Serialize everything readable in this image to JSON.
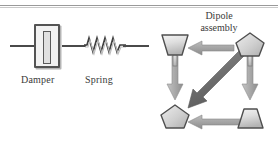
{
  "figure": {
    "background": "#ffffff",
    "rule_color": "#9a9a9a"
  },
  "mechanical_schematic": {
    "damper": {
      "label": "Damper",
      "icon": "damper-symbol",
      "body_fill": "#f2f2f2",
      "outline": "#545454"
    },
    "spring": {
      "label": "Spring",
      "icon": "spring-coil-symbol",
      "coils": 7,
      "stroke": "#3f3f3f"
    },
    "connector_line_color": "#4a4a4a"
  },
  "dipole_assembly": {
    "title_line1": "Dipole",
    "title_line2": "assembly",
    "node_fill_light": "#e8e8e8",
    "node_fill_mid": "#c2c2c2",
    "node_outline": "#4f4f4f",
    "arrow_fill": "#a9a9a9",
    "arrow_fill_dark": "#6f6f6f",
    "nodes": [
      {
        "id": "top-left",
        "shape": "trapezoid-wide-top",
        "position": "top-left"
      },
      {
        "id": "top-right",
        "shape": "pentagon",
        "position": "top-right"
      },
      {
        "id": "bottom-left",
        "shape": "pentagon",
        "position": "bottom-left"
      },
      {
        "id": "bottom-right",
        "shape": "trapezoid-wide-bottom",
        "position": "bottom-right"
      }
    ],
    "arrows": [
      {
        "id": "top-right-to-top-left",
        "direction": "leftward",
        "shade": "light"
      },
      {
        "id": "top-left-to-bottom-left",
        "direction": "downward",
        "shade": "light"
      },
      {
        "id": "top-right-to-bottom-right",
        "direction": "downward",
        "shade": "light"
      },
      {
        "id": "bottom-right-to-bottom-left",
        "direction": "leftward",
        "shade": "light"
      },
      {
        "id": "top-right-to-bottom-left-diagonal",
        "direction": "diagonal-down-left",
        "shade": "dark"
      }
    ]
  }
}
